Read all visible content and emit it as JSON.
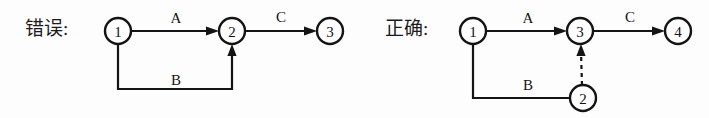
{
  "figure": {
    "name": "aoe-network-comparison",
    "background_color": "#fdfdfd",
    "ink_color": "#141414",
    "width": 709,
    "height": 118
  },
  "panels": [
    {
      "id": "incorrect",
      "caption": "错误:",
      "caption_x": 25,
      "caption_y": 31,
      "nodes": [
        {
          "id": "n1",
          "label": "1",
          "cx": 118,
          "cy": 31,
          "r": 13
        },
        {
          "id": "n2",
          "label": "2",
          "cx": 232,
          "cy": 31,
          "r": 13
        },
        {
          "id": "n3",
          "label": "3",
          "cx": 330,
          "cy": 31,
          "r": 13
        }
      ],
      "edges": [
        {
          "id": "e-a",
          "label": "A",
          "label_x": 176,
          "label_y": 23,
          "style": "solid",
          "path": "M 131 31 L 212 31",
          "arrow": {
            "x": 219,
            "y": 31,
            "dir": "right"
          }
        },
        {
          "id": "e-c",
          "label": "C",
          "label_x": 281,
          "label_y": 22,
          "style": "solid",
          "path": "M 245 31 L 310 31",
          "arrow": {
            "x": 317,
            "y": 31,
            "dir": "right"
          }
        },
        {
          "id": "e-b",
          "label": "B",
          "label_x": 176,
          "label_y": 85,
          "style": "solid",
          "path": "M 118 44 L 118 89 L 232 89 L 232 51",
          "arrow": {
            "x": 232,
            "y": 44,
            "dir": "up"
          }
        }
      ]
    },
    {
      "id": "correct",
      "caption": "正确:",
      "caption_x": 385,
      "caption_y": 31,
      "nodes": [
        {
          "id": "m1",
          "label": "1",
          "cx": 473,
          "cy": 31,
          "r": 13
        },
        {
          "id": "m3",
          "label": "3",
          "cx": 580,
          "cy": 31,
          "r": 13
        },
        {
          "id": "m4",
          "label": "4",
          "cx": 678,
          "cy": 31,
          "r": 13
        },
        {
          "id": "m2",
          "label": "2",
          "cx": 583,
          "cy": 98,
          "r": 13
        }
      ],
      "edges": [
        {
          "id": "f-a",
          "label": "A",
          "label_x": 528,
          "label_y": 23,
          "style": "solid",
          "path": "M 486 31 L 560 31",
          "arrow": {
            "x": 567,
            "y": 31,
            "dir": "right"
          }
        },
        {
          "id": "f-c",
          "label": "C",
          "label_x": 630,
          "label_y": 22,
          "style": "solid",
          "path": "M 593 31 L 658 31",
          "arrow": {
            "x": 665,
            "y": 31,
            "dir": "right"
          }
        },
        {
          "id": "f-b",
          "label": "B",
          "label_x": 528,
          "label_y": 90,
          "style": "solid",
          "path": "M 473 44 L 473 98 L 570 98",
          "arrow": null
        },
        {
          "id": "f-dummy",
          "label": "",
          "label_x": 0,
          "label_y": 0,
          "style": "dashed",
          "path": "M 582 85 L 581 52",
          "arrow": {
            "x": 581,
            "y": 44,
            "dir": "up"
          }
        }
      ]
    }
  ]
}
